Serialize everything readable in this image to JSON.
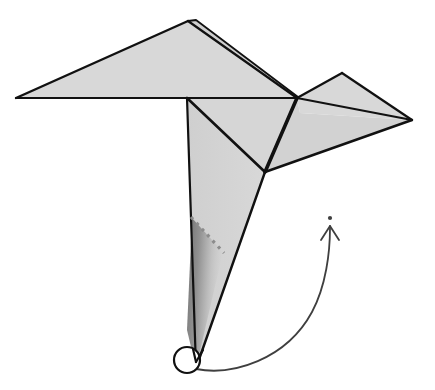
{
  "document": {
    "title": "Origami Fold Step Diagram",
    "background_color": "#ffffff",
    "width": 435,
    "height": 390
  },
  "style": {
    "paper_fill": "#d8d8d8",
    "paper_fill_light": "#dcdcdc",
    "paper_fill_mid": "#d2d2d2",
    "shadow_dark": "#7a7a7a",
    "outline_color": "#111111",
    "crease_color": "#111111",
    "dashed_color": "#8c8c8c",
    "arrow_color": "#3f3f3f",
    "pivot_fill": "#ffffff",
    "outline_width_thin": 2.0,
    "outline_width_thick": 3.4,
    "arrow_width": 1.8,
    "dash_pattern": "3 5"
  },
  "shapes": {
    "left_wing": {
      "name": "left-wing-panel",
      "points": "16,98 188,21 297,98",
      "fill": "#d8d8d8"
    },
    "upper_wing_fold": {
      "name": "upper-wing-fold-panel",
      "points": "188,21 196,20 298,97 297,98",
      "fill": "#cfcfcf"
    },
    "body_upper": {
      "name": "body-upper-panel",
      "points": "187,98 297,98 265,172",
      "fill": "#d6d6d6"
    },
    "body_left": {
      "name": "body-left-panel",
      "points": "187,98 265,172 196,368",
      "fill": "#d4d4d4"
    },
    "right_wing_upper": {
      "name": "right-wing-upper-panel",
      "points": "297,98 342,73 412,120 300,113",
      "fill": "#d8d8d8"
    },
    "right_wing_lower": {
      "name": "right-wing-lower-panel",
      "points": "297,98 300,113 412,120 265,172",
      "fill": "#d2d2d2"
    },
    "shadow_wedge": {
      "name": "shadow-gradient-wedge",
      "points": "192,218 223,252 196,368 187,330"
    }
  },
  "creases": [
    {
      "name": "crease-horizontal-spine",
      "d": "M16,98 L297,98",
      "width": 2.0
    },
    {
      "name": "crease-left-wing-upper",
      "d": "M16,98 L188,21",
      "width": 2.4
    },
    {
      "name": "crease-apex-ridge",
      "d": "M188,21 L297,98",
      "width": 2.2
    },
    {
      "name": "crease-apex-fold-edge",
      "d": "M188,21 L196,20 L298,97",
      "width": 1.8
    },
    {
      "name": "crease-body-vertical",
      "d": "M187,98 L196,368",
      "width": 2.2
    },
    {
      "name": "crease-body-diagonal",
      "d": "M187,98 L265,172",
      "width": 2.6
    },
    {
      "name": "crease-neck-thick",
      "d": "M297,98 L265,172",
      "width": 3.6
    },
    {
      "name": "crease-tail-outline",
      "d": "M265,172 L196,368",
      "width": 2.4
    },
    {
      "name": "crease-right-wing-top",
      "d": "M297,98 L342,73",
      "width": 2.2
    },
    {
      "name": "crease-right-wing-upper-edge",
      "d": "M342,73 L412,120",
      "width": 2.2
    },
    {
      "name": "crease-right-wing-mid",
      "d": "M297,98 L412,120",
      "width": 1.8
    },
    {
      "name": "crease-right-wing-lower",
      "d": "M412,120 L265,172",
      "width": 2.4
    }
  ],
  "dashed_fold": {
    "name": "valley-fold-dashed-line",
    "d": "M191,217 L224,253",
    "color": "#8c8c8c",
    "width": 3.2,
    "dash": "3 5"
  },
  "rotation_arrow": {
    "name": "rotation-arrow",
    "path": "M196,369 C232,376 286,360 312,312 C326,286 330,252 330,228",
    "head_tip_x": 330,
    "head_tip_y": 225,
    "head_left": "M330,226 L321,240",
    "head_right": "M330,226 L339,240",
    "dot_x": 330,
    "dot_y": 218,
    "dot_r": 2.1,
    "color": "#3f3f3f"
  },
  "pivot_point": {
    "name": "pivot-circle",
    "cx": 187,
    "cy": 360,
    "r": 13,
    "fill": "#ffffff",
    "stroke": "#111111",
    "stroke_width": 2.2
  }
}
